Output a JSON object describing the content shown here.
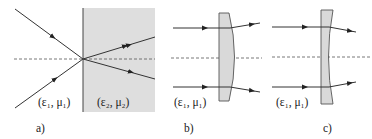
{
  "panels": [
    {
      "id": "a",
      "caption": "a)",
      "media_left_label": "(ε₁, μ₁)",
      "media_right_label": "(ε₂, μ₂)",
      "description": "Rays refracting at planar interface between two media"
    },
    {
      "id": "b",
      "caption": "b)",
      "media_label": "(ε₁, μ₁)",
      "description": "Plano-convex lens bending parallel rays outward"
    },
    {
      "id": "c",
      "caption": "c)",
      "media_label": "(ε₁, μ₁)",
      "description": "Plano-concave lens bending parallel rays inward"
    }
  ],
  "colors": {
    "ray": "#333333",
    "medium_fill": "#dedede",
    "lens_fill": "#d9d9d9",
    "axis": "#555555"
  }
}
